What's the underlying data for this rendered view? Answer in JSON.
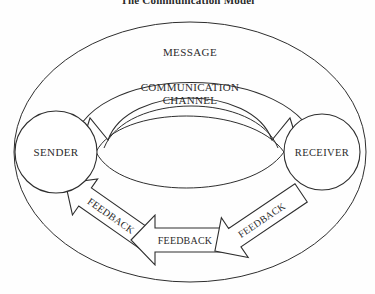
{
  "page": {
    "title": "The Communication Model",
    "background_color": "#fefefe",
    "ink_color": "#2e2e2e"
  },
  "diagram": {
    "type": "cycle-diagram",
    "nodes": [
      {
        "id": "sender",
        "label": "SENDER",
        "shape": "circle",
        "cx": 56,
        "cy": 152,
        "r": 41
      },
      {
        "id": "receiver",
        "label": "RECEIVER",
        "shape": "circle",
        "cx": 322,
        "cy": 152,
        "r": 38
      }
    ],
    "top_labels": [
      {
        "id": "message",
        "label": "MESSAGE",
        "x": 190,
        "y": 52
      },
      {
        "id": "channel-line-1",
        "label": "COMMUNICATION",
        "x": 190,
        "y": 88
      },
      {
        "id": "channel-line-2",
        "label": "CHANNEL",
        "x": 190,
        "y": 101
      }
    ],
    "feedback_arrows": [
      {
        "id": "feedback-left",
        "label": "FEEDBACK",
        "x": 108,
        "y": 213,
        "rotation": 35
      },
      {
        "id": "feedback-center",
        "label": "FEEDBACK",
        "x": 183,
        "y": 240,
        "rotation": 0
      },
      {
        "id": "feedback-right",
        "label": "FEEDBACK",
        "x": 258,
        "y": 222,
        "rotation": -34
      }
    ],
    "outer_ellipse": {
      "cx": 190,
      "cy": 152,
      "rx": 176,
      "ry": 130
    },
    "message_arrow_direction": "bidirectional",
    "feedback_direction": "receiver-to-sender"
  }
}
